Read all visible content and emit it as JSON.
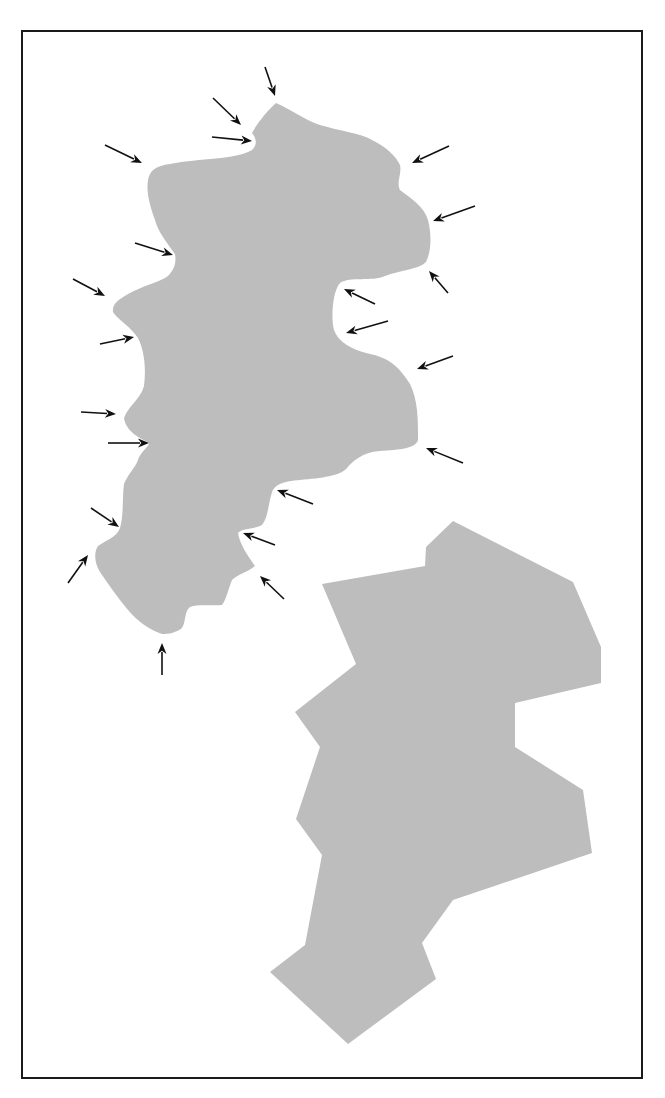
{
  "figure": {
    "background": "#ffffff",
    "frame": {
      "x": 22,
      "y": 31,
      "width": 620,
      "height": 1047,
      "stroke": "#1a1a1a"
    },
    "fill_color": "#bdbdbd",
    "arrow_color": "#111111"
  },
  "shapes": {
    "curved_region": {
      "label": "curved-region",
      "path": "M276,103 C292,110 305,120 320,125 C340,131 360,133 372,140 C386,147 396,156 400,165 C402,174 396,182 400,190 C410,198 424,206 428,220 C432,236 431,252 426,262 C418,270 400,270 385,276 C372,282 350,276 340,283 C332,292 331,320 334,330 C338,342 352,350 370,354 C390,358 400,368 410,384 C418,400 418,420 418,440 C416,448 400,450 380,451 C362,452 352,462 347,468 C340,476 322,478 300,480 C284,481 275,484 272,492 C268,505 268,518 262,525 C252,530 242,528 238,533 C240,545 248,556 255,566 C248,572 238,574 232,580 C228,590 226,600 222,605 C210,606 198,604 190,607 C184,612 186,622 182,628 C176,633 168,634 162,634 C150,630 138,622 128,610 C118,598 108,584 100,572 C94,562 94,552 98,546 C106,540 116,538 120,528 C124,514 122,498 124,484 C128,474 135,468 138,460 C140,452 150,446 149,443 C140,438 126,432 124,418 C128,406 140,400 144,386 C146,370 145,352 138,338 C130,326 118,320 113,312 C112,304 118,300 128,294 C142,286 160,282 168,276 C176,268 176,260 175,254 C168,244 158,232 155,220 C150,206 146,192 148,180 C150,170 156,166 170,164 C200,158 235,160 252,150 C258,144 256,138 252,133 C258,122 268,110 276,103 Z"
    },
    "polygonal_region": {
      "label": "polygonal-region",
      "points": [
        [
          453,
          521
        ],
        [
          573,
          582
        ],
        [
          601,
          647
        ],
        [
          601,
          683
        ],
        [
          515,
          703
        ],
        [
          515,
          747
        ],
        [
          583,
          790
        ],
        [
          592,
          853
        ],
        [
          453,
          900
        ],
        [
          422,
          943
        ],
        [
          436,
          979
        ],
        [
          348,
          1044
        ],
        [
          270,
          972
        ],
        [
          305,
          945
        ],
        [
          322,
          855
        ],
        [
          296,
          819
        ],
        [
          320,
          747
        ],
        [
          295,
          712
        ],
        [
          356,
          664
        ],
        [
          322,
          584
        ],
        [
          425,
          566
        ],
        [
          426,
          547
        ]
      ]
    }
  },
  "arrows": [
    {
      "id": "arrow-1",
      "from": [
        265,
        67
      ],
      "to": [
        275,
        96
      ]
    },
    {
      "id": "arrow-2",
      "from": [
        213,
        98
      ],
      "to": [
        241,
        125
      ]
    },
    {
      "id": "arrow-3",
      "from": [
        212,
        137
      ],
      "to": [
        252,
        141
      ]
    },
    {
      "id": "arrow-4",
      "from": [
        449,
        146
      ],
      "to": [
        412,
        163
      ]
    },
    {
      "id": "arrow-5",
      "from": [
        475,
        206
      ],
      "to": [
        433,
        221
      ]
    },
    {
      "id": "arrow-6",
      "from": [
        448,
        293
      ],
      "to": [
        429,
        271
      ]
    },
    {
      "id": "arrow-7",
      "from": [
        375,
        304
      ],
      "to": [
        344,
        289
      ]
    },
    {
      "id": "arrow-8",
      "from": [
        388,
        321
      ],
      "to": [
        346,
        333
      ]
    },
    {
      "id": "arrow-9",
      "from": [
        453,
        356
      ],
      "to": [
        417,
        369
      ]
    },
    {
      "id": "arrow-10",
      "from": [
        463,
        463
      ],
      "to": [
        426,
        448
      ]
    },
    {
      "id": "arrow-11",
      "from": [
        313,
        504
      ],
      "to": [
        277,
        490
      ]
    },
    {
      "id": "arrow-12",
      "from": [
        275,
        545
      ],
      "to": [
        243,
        533
      ]
    },
    {
      "id": "arrow-13",
      "from": [
        284,
        599
      ],
      "to": [
        260,
        576
      ]
    },
    {
      "id": "arrow-14",
      "from": [
        105,
        145
      ],
      "to": [
        142,
        163
      ]
    },
    {
      "id": "arrow-15",
      "from": [
        135,
        243
      ],
      "to": [
        173,
        255
      ]
    },
    {
      "id": "arrow-16",
      "from": [
        73,
        279
      ],
      "to": [
        105,
        296
      ]
    },
    {
      "id": "arrow-17",
      "from": [
        100,
        344
      ],
      "to": [
        134,
        337
      ]
    },
    {
      "id": "arrow-18",
      "from": [
        81,
        412
      ],
      "to": [
        116,
        414
      ]
    },
    {
      "id": "arrow-19",
      "from": [
        108,
        443
      ],
      "to": [
        149,
        443
      ]
    },
    {
      "id": "arrow-20",
      "from": [
        91,
        508
      ],
      "to": [
        119,
        527
      ]
    },
    {
      "id": "arrow-21",
      "from": [
        68,
        583
      ],
      "to": [
        88,
        555
      ]
    },
    {
      "id": "arrow-22",
      "from": [
        162,
        675
      ],
      "to": [
        162,
        643
      ]
    }
  ]
}
